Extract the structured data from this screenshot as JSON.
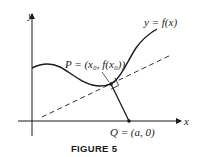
{
  "figure": {
    "caption": "FIGURE 5",
    "axis_x_label": "x",
    "axis_y_label": "y",
    "curve_label": "y = f(x)",
    "point_p_label": "P = (x₀, f(x₀))",
    "point_q_label": "Q = (a, 0)"
  },
  "colors": {
    "ink": "#1a1a1a",
    "background": "#ffffff"
  }
}
